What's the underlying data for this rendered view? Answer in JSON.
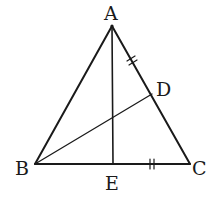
{
  "diagram": {
    "type": "triangle-geometry",
    "stroke_color": "#1a1a1a",
    "background": "#ffffff",
    "points": {
      "A": {
        "label": "A",
        "x": 112,
        "y": 26
      },
      "B": {
        "label": "B",
        "x": 35,
        "y": 164
      },
      "C": {
        "label": "C",
        "x": 190,
        "y": 164
      },
      "D": {
        "label": "D",
        "x": 152,
        "y": 94
      },
      "E": {
        "label": "E",
        "x": 113,
        "y": 164
      }
    },
    "segments": [
      "AB",
      "AC",
      "BC",
      "AE",
      "BD"
    ],
    "equal_marks": [
      {
        "segment": "AD",
        "mark": "double-tick"
      },
      {
        "segment": "EC",
        "mark": "double-tick"
      }
    ]
  }
}
